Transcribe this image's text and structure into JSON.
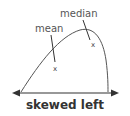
{
  "diagram": {
    "caption": "skewed left",
    "labels": {
      "median": "median",
      "mean": "mean"
    },
    "markers": {
      "mean_mark": "x",
      "median_mark": "x"
    },
    "colors": {
      "curve": "#555555",
      "axis": "#333333",
      "text": "#555555"
    }
  }
}
